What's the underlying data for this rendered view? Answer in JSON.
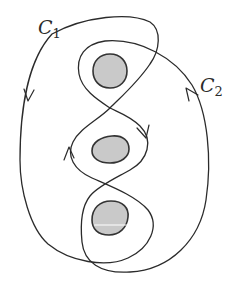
{
  "labels": {
    "c1": {
      "main": "C",
      "sub": "1"
    },
    "c2": {
      "main": "C",
      "sub": "2"
    }
  },
  "colors": {
    "stroke": "#2b2b2b",
    "blob_fill": "#c9c9c9",
    "blob_stroke": "#333333",
    "background": "#ffffff"
  },
  "diagram": {
    "holes": [
      {
        "name": "top-hole",
        "cx": 110,
        "cy": 70
      },
      {
        "name": "middle-hole",
        "cx": 110,
        "cy": 149
      },
      {
        "name": "bottom-hole",
        "cx": 110,
        "cy": 218
      }
    ],
    "curves": [
      {
        "name": "C1",
        "orientation": "down on left side, up around middle hole's left"
      },
      {
        "name": "C2",
        "orientation": "up on right side, down around middle hole's right"
      }
    ]
  }
}
